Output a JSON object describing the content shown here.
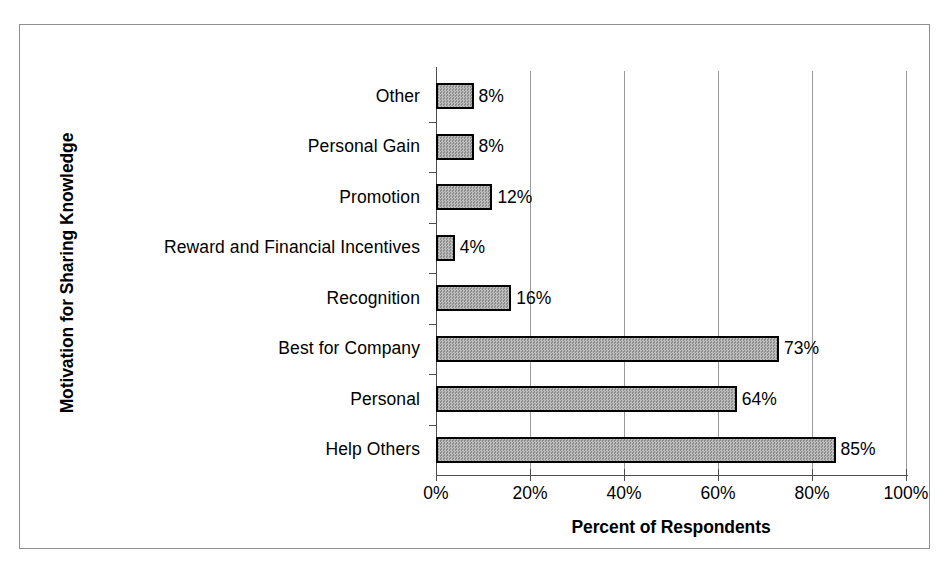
{
  "chart_data": {
    "type": "bar",
    "orientation": "horizontal",
    "title": "",
    "xlabel": "Percent of Respondents",
    "ylabel": "Motivation for Sharing Knowledge",
    "categories": [
      "Other",
      "Personal Gain",
      "Promotion",
      "Reward and Financial Incentives",
      "Recognition",
      "Best for Company",
      "Personal",
      "Help Others"
    ],
    "values": [
      8,
      8,
      12,
      4,
      16,
      73,
      64,
      85
    ],
    "data_labels": [
      "8%",
      "8%",
      "12%",
      "4%",
      "16%",
      "73%",
      "64%",
      "85%"
    ],
    "xlim": [
      0,
      100
    ],
    "x_ticks": [
      0,
      20,
      40,
      60,
      80,
      100
    ],
    "x_tick_labels": [
      "0%",
      "20%",
      "40%",
      "60%",
      "80%",
      "100%"
    ],
    "grid": "vertical",
    "legend": "none",
    "bar_fill_color": "#a8a8a8",
    "bar_border_color": "#000000",
    "gridline_color": "#9a9a9a",
    "axis_color": "#4d4d4d",
    "frame_color": "#8f8f8f",
    "background_color": "#ffffff"
  }
}
